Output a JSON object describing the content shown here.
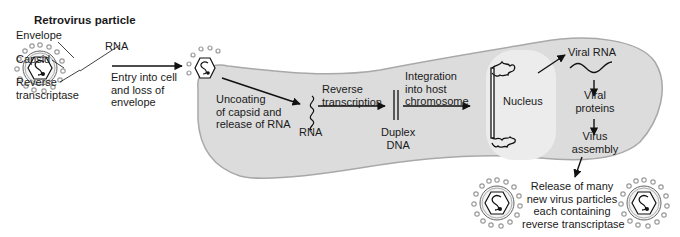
{
  "title": "Retrovirus particle",
  "particle_labels": {
    "envelope": "Envelope",
    "rna": "RNA",
    "capsid": "Capsid",
    "reverse_transcriptase_1": "Reverse",
    "reverse_transcriptase_2": "transcriptase"
  },
  "steps": {
    "entry": [
      "Entry into cell",
      "and loss of",
      "envelope"
    ],
    "uncoating": [
      "Uncoating",
      "of capsid and",
      "release of RNA"
    ],
    "rna": "RNA",
    "reverse_transcription": [
      "Reverse",
      "transcription"
    ],
    "duplex_dna": [
      "Duplex",
      "DNA"
    ],
    "integration": [
      "Integration",
      "into host",
      "chromosome"
    ],
    "nucleus": "Nucleus",
    "viral_rna": "Viral RNA",
    "viral_proteins": [
      "Viral",
      "proteins"
    ],
    "virus_assembly": [
      "Virus",
      "assembly"
    ],
    "release": [
      "Release of many",
      "new virus particles",
      "each containing",
      "reverse transcriptase"
    ]
  },
  "colors": {
    "cell_fill": "#dcdcdc",
    "cell_stroke": "#a8a8a8",
    "nucleus_fill": "#ececec",
    "spike": "#9a9a9a",
    "ink": "#111111"
  }
}
